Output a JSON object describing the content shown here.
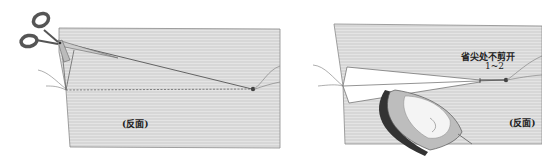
{
  "figure": {
    "panels": [
      {
        "id": "cut-dart",
        "description": "Scissors cutting along the fold of a dart on fabric (wrong side)",
        "labels": {
          "side": "(反面)"
        },
        "icons": [
          "scissors-icon",
          "thread-icon",
          "knot-icon"
        ]
      },
      {
        "id": "press-dart",
        "description": "Iron pressing the dart open on fabric (wrong side)",
        "labels": {
          "annotation": "省尖处不剪开",
          "measurement": "1~2",
          "side": "(反面)"
        },
        "icons": [
          "iron-icon",
          "thread-icon",
          "knot-icon"
        ]
      }
    ],
    "colors": {
      "fabric": "#d6d6d6",
      "fabric_stripe": "#e6e6e6",
      "outline": "#8a8a8a",
      "line": "#555555",
      "background": "#ffffff"
    }
  }
}
